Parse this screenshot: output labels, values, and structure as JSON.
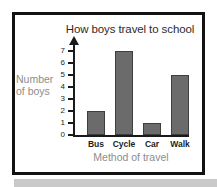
{
  "chart_data": {
    "type": "bar",
    "title": "How boys travel to school",
    "categories": [
      "Bus",
      "Cycle",
      "Car",
      "Walk"
    ],
    "values": [
      2,
      7,
      1,
      5
    ],
    "xlabel": "Method of travel",
    "ylabel": "Number of boys",
    "ylabel_line1": "Number",
    "ylabel_line2": "of boys",
    "ylim": [
      0,
      7
    ],
    "ytick_labels": [
      "0",
      "1",
      "2",
      "3",
      "4",
      "5",
      "6",
      "7"
    ],
    "ytick_values": [
      0,
      1,
      2,
      3,
      4,
      5,
      6,
      7
    ],
    "grid": false,
    "legend": false,
    "bar_color": "#6b6b6b",
    "bar_edge_color": "#3d3d3d",
    "axis_color": "#1a1a1a",
    "title_color": "#2b2b2b",
    "axis_label_color": "#8d8d8d",
    "frame_color": "#121212",
    "background_color": "#ffffff"
  },
  "page": {
    "strip_color": "#c9c9c9"
  }
}
